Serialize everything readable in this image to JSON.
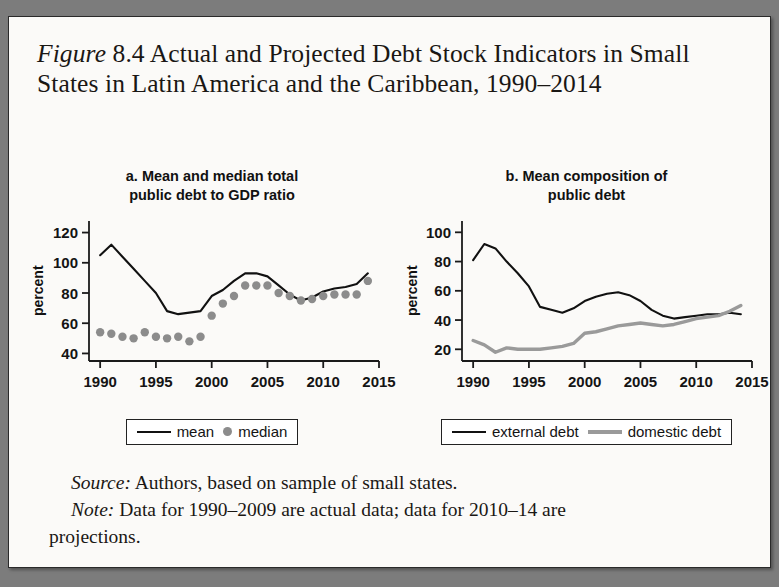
{
  "figure": {
    "label": "Figure",
    "number": "8.4",
    "title_rest": " Actual and Projected Debt Stock Indicators in Small States in Latin America and the Caribbean, 1990–2014"
  },
  "panels": [
    {
      "id": "a",
      "title": "a. Mean and median total public debt to GDP ratio",
      "title_line1": "a. Mean and median total",
      "title_line2": "public debt to GDP ratio",
      "ylabel": "percent",
      "legend": [
        {
          "label": "mean",
          "marker": "line",
          "color": "#111111"
        },
        {
          "label": "median",
          "marker": "dot",
          "color": "#8c8c8c"
        }
      ]
    },
    {
      "id": "b",
      "title": "b. Mean composition of public debt",
      "title_line1": "b. Mean composition of",
      "title_line2": "public debt",
      "ylabel": "percent",
      "legend": [
        {
          "label": "external debt",
          "marker": "line",
          "color": "#111111"
        },
        {
          "label": "domestic debt",
          "marker": "line-gray",
          "color": "#9a9a9a"
        }
      ]
    }
  ],
  "source": {
    "label": "Source:",
    "text": " Authors, based on sample of small states."
  },
  "note": {
    "label": "Note:",
    "text": " Data for 1990–2009 are actual data; data for 2010–14 are",
    "text2": "projections."
  },
  "chart_data": [
    {
      "type": "line",
      "panel": "a",
      "title": "a. Mean and median total public debt to GDP ratio",
      "xlabel": "",
      "ylabel": "percent",
      "xlim": [
        1989,
        2015
      ],
      "ylim": [
        35,
        125
      ],
      "yticks": [
        40,
        60,
        80,
        100,
        120
      ],
      "xticks": [
        1990,
        1995,
        2000,
        2005,
        2010,
        2015
      ],
      "grid": false,
      "legend_position": "bottom",
      "x": [
        1990,
        1991,
        1992,
        1993,
        1994,
        1995,
        1996,
        1997,
        1998,
        1999,
        2000,
        2001,
        2002,
        2003,
        2004,
        2005,
        2006,
        2007,
        2008,
        2009,
        2010,
        2011,
        2012,
        2013,
        2014
      ],
      "series": [
        {
          "name": "mean",
          "style": "line",
          "color": "#111111",
          "values": [
            105,
            112,
            104,
            96,
            88,
            80,
            68,
            66,
            67,
            68,
            78,
            82,
            88,
            93,
            93,
            91,
            85,
            79,
            75,
            77,
            81,
            83,
            84,
            86,
            93
          ]
        },
        {
          "name": "median",
          "style": "dots",
          "color": "#8c8c8c",
          "values": [
            54,
            53,
            51,
            50,
            54,
            51,
            50,
            51,
            48,
            51,
            65,
            73,
            78,
            85,
            85,
            85,
            80,
            78,
            75,
            76,
            78,
            79,
            79,
            79,
            88
          ]
        }
      ]
    },
    {
      "type": "line",
      "panel": "b",
      "title": "b. Mean composition of public debt",
      "xlabel": "",
      "ylabel": "percent",
      "xlim": [
        1989,
        2015
      ],
      "ylim": [
        12,
        105
      ],
      "yticks": [
        20,
        40,
        60,
        80,
        100
      ],
      "xticks": [
        1990,
        1995,
        2000,
        2005,
        2010,
        2015
      ],
      "grid": false,
      "legend_position": "bottom",
      "x": [
        1990,
        1991,
        1992,
        1993,
        1994,
        1995,
        1996,
        1997,
        1998,
        1999,
        2000,
        2001,
        2002,
        2003,
        2004,
        2005,
        2006,
        2007,
        2008,
        2009,
        2010,
        2011,
        2012,
        2013,
        2014
      ],
      "series": [
        {
          "name": "external debt",
          "style": "line",
          "color": "#111111",
          "values": [
            81,
            92,
            89,
            80,
            72,
            63,
            49,
            47,
            45,
            48,
            53,
            56,
            58,
            59,
            57,
            53,
            47,
            43,
            41,
            42,
            43,
            44,
            44,
            45,
            44
          ]
        },
        {
          "name": "domestic debt",
          "style": "line",
          "color": "#9a9a9a",
          "values": [
            26,
            23,
            18,
            21,
            20,
            20,
            20,
            21,
            22,
            24,
            31,
            32,
            34,
            36,
            37,
            38,
            37,
            36,
            37,
            39,
            41,
            42,
            43,
            46,
            50
          ]
        }
      ]
    }
  ]
}
